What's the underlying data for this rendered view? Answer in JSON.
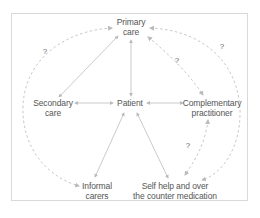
{
  "diagram": {
    "nodes": [
      {
        "id": "primary",
        "lines": [
          "Primary",
          "care"
        ],
        "x": 131,
        "y": 17
      },
      {
        "id": "secondary",
        "lines": [
          "Secondary",
          "care"
        ],
        "x": 53,
        "y": 101
      },
      {
        "id": "patient",
        "lines": [
          "Patient"
        ],
        "x": 130,
        "y": 101
      },
      {
        "id": "complementary",
        "lines": [
          "Complementary",
          "practitioner"
        ],
        "x": 210,
        "y": 101
      },
      {
        "id": "informal",
        "lines": [
          "Informal",
          "carers"
        ],
        "x": 97,
        "y": 183
      },
      {
        "id": "selfhelp",
        "lines": [
          "Self help and over",
          "the counter medication"
        ],
        "x": 178,
        "y": 183
      }
    ],
    "question_marks": [
      {
        "label": "?",
        "x": 45,
        "y": 49
      },
      {
        "label": "?",
        "x": 177,
        "y": 58
      },
      {
        "label": "?",
        "x": 222,
        "y": 44
      },
      {
        "label": "?",
        "x": 188,
        "y": 143
      }
    ],
    "solid_links": [
      [
        "primary",
        "patient"
      ],
      [
        "primary",
        "secondary"
      ],
      [
        "secondary",
        "patient"
      ],
      [
        "patient",
        "complementary"
      ],
      [
        "patient",
        "informal"
      ],
      [
        "patient",
        "selfhelp"
      ]
    ],
    "dashed_links": [
      [
        "primary",
        "secondary",
        "via outer arc",
        "?"
      ],
      [
        "primary",
        "complementary",
        "?"
      ],
      [
        "primary",
        "selfhelp",
        "via outer arc",
        "?"
      ],
      [
        "complementary",
        "selfhelp",
        "?"
      ],
      [
        "secondary",
        "informal",
        "via outer arc"
      ]
    ],
    "colors": {
      "solid_line": "#bdbdbd",
      "dashed_line": "#c8c8c8",
      "text": "#555555",
      "frame": "#d9d9d9"
    }
  }
}
